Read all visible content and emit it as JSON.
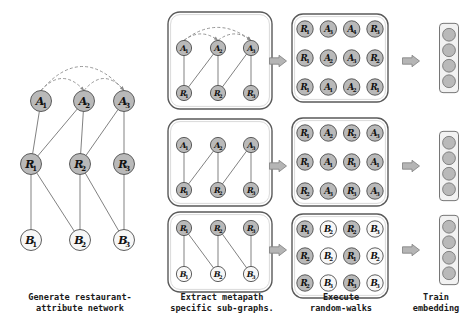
{
  "figure": {
    "colors": {
      "node_gray_fill": "#b9b9b9",
      "node_white_fill": "#f7f7f7",
      "node_stroke": "#4d4d4d",
      "edge": "#7a7a7a",
      "dashed_edge": "#8a8a8a",
      "panel_stroke": "#5a5a5a",
      "arrow_fill": "#b5b5b5",
      "arrow_stroke": "#7d7d7d",
      "text": "#111111",
      "background": "#ffffff"
    }
  },
  "captions": [
    {
      "id": "generate",
      "text": "Generate restaurant-\nattribute network"
    },
    {
      "id": "extract",
      "text": "Extract metapath\nspecific sub-graphs."
    },
    {
      "id": "walks",
      "text": "Execute\nrandom-walks"
    },
    {
      "id": "train",
      "text": "Train\nembedding"
    }
  ],
  "stage1_network": {
    "name": "restaurant-attribute-network",
    "layers": [
      {
        "role": "attribute",
        "nodes": [
          {
            "id": "A1",
            "label": "A",
            "sub": "1",
            "fill": "gray",
            "x": 41,
            "y": 101
          },
          {
            "id": "A2",
            "label": "A",
            "sub": "2",
            "fill": "gray",
            "x": 84,
            "y": 101
          },
          {
            "id": "A3",
            "label": "A",
            "sub": "3",
            "fill": "gray",
            "x": 124,
            "y": 101
          }
        ]
      },
      {
        "role": "restaurant",
        "nodes": [
          {
            "id": "R1",
            "label": "R",
            "sub": "1",
            "fill": "gray",
            "x": 31,
            "y": 164
          },
          {
            "id": "R2",
            "label": "R",
            "sub": "2",
            "fill": "gray",
            "x": 80,
            "y": 164
          },
          {
            "id": "R3",
            "label": "R",
            "sub": "3",
            "fill": "gray",
            "x": 124,
            "y": 164
          }
        ]
      },
      {
        "role": "business",
        "nodes": [
          {
            "id": "B1",
            "label": "B",
            "sub": "1",
            "fill": "white",
            "x": 31,
            "y": 240
          },
          {
            "id": "B2",
            "label": "B",
            "sub": "2",
            "fill": "white",
            "x": 80,
            "y": 240
          },
          {
            "id": "B3",
            "label": "B",
            "sub": "3",
            "fill": "white",
            "x": 124,
            "y": 240
          }
        ]
      }
    ],
    "solid_edges": [
      [
        "A1",
        "R1"
      ],
      [
        "A2",
        "R1"
      ],
      [
        "A2",
        "R2"
      ],
      [
        "A3",
        "R2"
      ],
      [
        "A3",
        "R3"
      ],
      [
        "R1",
        "B1"
      ],
      [
        "R1",
        "B2"
      ],
      [
        "R2",
        "B2"
      ],
      [
        "R2",
        "B3"
      ],
      [
        "R3",
        "B3"
      ]
    ],
    "dashed_edges": [
      {
        "from": "A1",
        "to": "A2",
        "arc": "low"
      },
      {
        "from": "A2",
        "to": "A3",
        "arc": "low"
      },
      {
        "from": "A1",
        "to": "A3",
        "arc": "high"
      }
    ]
  },
  "stage2_subgraphs": [
    {
      "id": "subgraph-aa-ar",
      "metapath": "A-A-R",
      "top": [
        {
          "id": "A1",
          "label": "A",
          "sub": "1",
          "fill": "gray",
          "x": 184,
          "y": 48
        },
        {
          "id": "A2",
          "label": "A",
          "sub": "2",
          "fill": "gray",
          "x": 218,
          "y": 48
        },
        {
          "id": "A3",
          "label": "A",
          "sub": "3",
          "fill": "gray",
          "x": 251,
          "y": 48
        }
      ],
      "bottom": [
        {
          "id": "R1",
          "label": "R",
          "sub": "1",
          "fill": "gray",
          "x": 184,
          "y": 93
        },
        {
          "id": "R2",
          "label": "R",
          "sub": "2",
          "fill": "gray",
          "x": 218,
          "y": 93
        },
        {
          "id": "R3",
          "label": "R",
          "sub": "3",
          "fill": "gray",
          "x": 251,
          "y": 93
        }
      ],
      "solid_edges": [
        [
          "A1",
          "R1"
        ],
        [
          "A2",
          "R1"
        ],
        [
          "A2",
          "R2"
        ],
        [
          "A3",
          "R2"
        ],
        [
          "A3",
          "R3"
        ]
      ],
      "dashed_edges": [
        {
          "from": "A1",
          "to": "A2",
          "arc": "low"
        },
        {
          "from": "A2",
          "to": "A3",
          "arc": "low"
        },
        {
          "from": "A1",
          "to": "A3",
          "arc": "high"
        }
      ]
    },
    {
      "id": "subgraph-ar",
      "metapath": "A-R",
      "top": [
        {
          "id": "A1",
          "label": "A",
          "sub": "1",
          "fill": "gray",
          "x": 184,
          "y": 145
        },
        {
          "id": "A2",
          "label": "A",
          "sub": "2",
          "fill": "gray",
          "x": 218,
          "y": 145
        },
        {
          "id": "A3",
          "label": "A",
          "sub": "3",
          "fill": "gray",
          "x": 251,
          "y": 145
        }
      ],
      "bottom": [
        {
          "id": "R1",
          "label": "R",
          "sub": "1",
          "fill": "gray",
          "x": 184,
          "y": 190
        },
        {
          "id": "R2",
          "label": "R",
          "sub": "2",
          "fill": "gray",
          "x": 218,
          "y": 190
        },
        {
          "id": "R3",
          "label": "R",
          "sub": "3",
          "fill": "gray",
          "x": 251,
          "y": 190
        }
      ],
      "solid_edges": [
        [
          "A1",
          "R1"
        ],
        [
          "A2",
          "R1"
        ],
        [
          "A2",
          "R2"
        ],
        [
          "A3",
          "R2"
        ],
        [
          "A3",
          "R3"
        ]
      ],
      "dashed_edges": []
    },
    {
      "id": "subgraph-rb",
      "metapath": "R-B",
      "top": [
        {
          "id": "R1",
          "label": "R",
          "sub": "1",
          "fill": "gray",
          "x": 184,
          "y": 228
        },
        {
          "id": "R2",
          "label": "R",
          "sub": "2",
          "fill": "gray",
          "x": 218,
          "y": 228
        },
        {
          "id": "R3",
          "label": "R",
          "sub": "3",
          "fill": "gray",
          "x": 251,
          "y": 228
        }
      ],
      "bottom": [
        {
          "id": "B1",
          "label": "B",
          "sub": "1",
          "fill": "white",
          "x": 184,
          "y": 274
        },
        {
          "id": "B2",
          "label": "B",
          "sub": "2",
          "fill": "white",
          "x": 218,
          "y": 274
        },
        {
          "id": "B3",
          "label": "B",
          "sub": "3",
          "fill": "white",
          "x": 251,
          "y": 274
        }
      ],
      "solid_edges": [
        [
          "R1",
          "B1"
        ],
        [
          "R1",
          "B2"
        ],
        [
          "R2",
          "B2"
        ],
        [
          "R2",
          "B3"
        ],
        [
          "R3",
          "B3"
        ]
      ],
      "dashed_edges": []
    }
  ],
  "stage3_walks": [
    {
      "id": "walks-aar",
      "rows": [
        [
          {
            "label": "R",
            "sub": "1",
            "fill": "gray"
          },
          {
            "label": "A",
            "sub": "3",
            "fill": "gray"
          },
          {
            "label": "A",
            "sub": "4",
            "fill": "gray"
          },
          {
            "label": "R",
            "sub": "3",
            "fill": "gray"
          }
        ],
        [
          {
            "label": "R",
            "sub": "1",
            "fill": "gray"
          },
          {
            "label": "A",
            "sub": "2",
            "fill": "gray"
          },
          {
            "label": "A",
            "sub": "3",
            "fill": "gray"
          },
          {
            "label": "R",
            "sub": "2",
            "fill": "gray"
          }
        ],
        [
          {
            "label": "R",
            "sub": "1",
            "fill": "gray"
          },
          {
            "label": "A",
            "sub": "1",
            "fill": "gray"
          },
          {
            "label": "A",
            "sub": "2",
            "fill": "gray"
          },
          {
            "label": "R",
            "sub": "1",
            "fill": "gray"
          }
        ]
      ]
    },
    {
      "id": "walks-ar",
      "rows": [
        [
          {
            "label": "R",
            "sub": "1",
            "fill": "gray"
          },
          {
            "label": "A",
            "sub": "2",
            "fill": "gray"
          },
          {
            "label": "R",
            "sub": "2",
            "fill": "gray"
          },
          {
            "label": "A",
            "sub": "3",
            "fill": "gray"
          }
        ],
        [
          {
            "label": "R",
            "sub": "1",
            "fill": "gray"
          },
          {
            "label": "A",
            "sub": "1",
            "fill": "gray"
          },
          {
            "label": "R",
            "sub": "1",
            "fill": "gray"
          },
          {
            "label": "A",
            "sub": "1",
            "fill": "gray"
          }
        ],
        [
          {
            "label": "R",
            "sub": "2",
            "fill": "gray"
          },
          {
            "label": "A",
            "sub": "3",
            "fill": "gray"
          },
          {
            "label": "R",
            "sub": "3",
            "fill": "gray"
          },
          {
            "label": "A",
            "sub": "3",
            "fill": "gray"
          }
        ]
      ]
    },
    {
      "id": "walks-rb",
      "rows": [
        [
          {
            "label": "R",
            "sub": "1",
            "fill": "gray"
          },
          {
            "label": "B",
            "sub": "2",
            "fill": "white"
          },
          {
            "label": "R",
            "sub": "2",
            "fill": "gray"
          },
          {
            "label": "B",
            "sub": "3",
            "fill": "white"
          }
        ],
        [
          {
            "label": "R",
            "sub": "2",
            "fill": "gray"
          },
          {
            "label": "B",
            "sub": "2",
            "fill": "white"
          },
          {
            "label": "R",
            "sub": "1",
            "fill": "gray"
          },
          {
            "label": "B",
            "sub": "2",
            "fill": "white"
          }
        ],
        [
          {
            "label": "R",
            "sub": "2",
            "fill": "gray"
          },
          {
            "label": "B",
            "sub": "3",
            "fill": "white"
          },
          {
            "label": "R",
            "sub": "3",
            "fill": "gray"
          },
          {
            "label": "B",
            "sub": "3",
            "fill": "white"
          }
        ]
      ]
    }
  ],
  "stage4_embeddings": [
    {
      "id": "embedding-1",
      "cells": 4,
      "x": 449,
      "y": 58
    },
    {
      "id": "embedding-2",
      "cells": 4,
      "x": 449,
      "y": 166
    },
    {
      "id": "embedding-3",
      "cells": 4,
      "x": 449,
      "y": 250
    }
  ],
  "arrows": [
    {
      "id": "arrow-sub-to-walk-1",
      "x": 278,
      "y": 61
    },
    {
      "id": "arrow-sub-to-walk-2",
      "x": 278,
      "y": 166
    },
    {
      "id": "arrow-sub-to-walk-3",
      "x": 278,
      "y": 250
    },
    {
      "id": "arrow-walk-to-emb-1",
      "x": 411,
      "y": 61
    },
    {
      "id": "arrow-walk-to-emb-2",
      "x": 411,
      "y": 166
    },
    {
      "id": "arrow-walk-to-emb-3",
      "x": 411,
      "y": 250
    }
  ]
}
